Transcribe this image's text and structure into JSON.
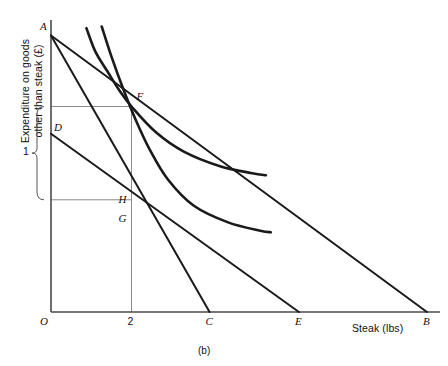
{
  "figure": {
    "caption": "(b)",
    "axes": {
      "ylabel": "Expenditure on goods\nother than steak (£)",
      "xlabel": "Steak  (lbs)",
      "origin_label": "O",
      "x_ticks": [
        {
          "label": "2",
          "x": 2.0
        },
        {
          "label": "C",
          "x": 3.94
        },
        {
          "label": "E",
          "x": 6.16
        },
        {
          "label": "B",
          "x": 9.34
        }
      ],
      "y_ticks": [
        {
          "label": "1",
          "value": 1
        }
      ]
    },
    "points": [
      {
        "label": "A",
        "x": 0.0,
        "y": 8.33
      },
      {
        "label": "D",
        "x": 0.0,
        "y": 5.37
      },
      {
        "label": "F",
        "x": 2.0,
        "y": 6.19
      },
      {
        "label": "H",
        "x": 2.0,
        "y": 3.38
      },
      {
        "label": "G",
        "x": 2.0,
        "y": 3.03
      }
    ],
    "budget_lines": [
      {
        "name": "AB",
        "from": {
          "x": 0.0,
          "y": 8.33
        },
        "to": {
          "x": 9.34,
          "y": 0.0
        }
      },
      {
        "name": "AC",
        "from": {
          "x": 0.0,
          "y": 8.33
        },
        "to": {
          "x": 3.94,
          "y": 0.0
        }
      },
      {
        "name": "DE",
        "from": {
          "x": 0.0,
          "y": 5.37
        },
        "to": {
          "x": 6.16,
          "y": 0.0
        }
      }
    ],
    "indifference_curves": [
      {
        "name": "upper-curve-through-F",
        "points": [
          {
            "x": 0.88,
            "y": 8.55
          },
          {
            "x": 1.1,
            "y": 7.85
          },
          {
            "x": 1.4,
            "y": 7.25
          },
          {
            "x": 1.7,
            "y": 6.67
          },
          {
            "x": 2.0,
            "y": 6.19
          },
          {
            "x": 2.6,
            "y": 5.42
          },
          {
            "x": 3.3,
            "y": 4.83
          },
          {
            "x": 4.2,
            "y": 4.39
          },
          {
            "x": 5.0,
            "y": 4.18
          },
          {
            "x": 5.34,
            "y": 4.12
          }
        ]
      },
      {
        "name": "lower-curve-through-G",
        "points": [
          {
            "x": 1.26,
            "y": 8.6
          },
          {
            "x": 1.5,
            "y": 7.7
          },
          {
            "x": 1.8,
            "y": 6.7
          },
          {
            "x": 2.1,
            "y": 5.8
          },
          {
            "x": 2.45,
            "y": 4.9
          },
          {
            "x": 2.9,
            "y": 4.0
          },
          {
            "x": 3.55,
            "y": 3.2
          },
          {
            "x": 4.4,
            "y": 2.7
          },
          {
            "x": 5.2,
            "y": 2.45
          },
          {
            "x": 5.46,
            "y": 2.4
          }
        ]
      }
    ],
    "gridlines": [
      {
        "name": "F-horizontal",
        "y": 6.19,
        "from_x": 0.0,
        "to_x": 2.0
      },
      {
        "name": "H-horizontal",
        "y": 3.38,
        "from_x": 0.0,
        "to_x": 2.0
      },
      {
        "name": "x2-vertical",
        "x": 2.0,
        "from_y": 0.0,
        "to_y": 6.19
      }
    ],
    "brace": {
      "label": "1",
      "spans_from_y": 6.19,
      "spans_to_y": 3.38
    }
  }
}
